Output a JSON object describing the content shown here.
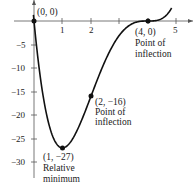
{
  "chart_data": {
    "type": "line",
    "title": "",
    "function": "f(x) = x(x - 4)^3",
    "xlabel": "",
    "ylabel": "",
    "xlim": [
      0,
      5.3
    ],
    "ylim": [
      -32,
      4
    ],
    "grid": false,
    "x_ticks": [
      1,
      2,
      5
    ],
    "x_tick_labels": [
      "1",
      "2",
      "5"
    ],
    "y_ticks": [
      -5,
      -10,
      -15,
      -20,
      -25,
      -30
    ],
    "y_tick_labels": [
      "-5",
      "-10",
      "-15",
      "-20",
      "-25",
      "-30"
    ],
    "series": [
      {
        "name": "f(x)",
        "x": [
          0,
          0.25,
          0.5,
          0.75,
          1,
          1.25,
          1.5,
          1.75,
          2,
          2.25,
          2.5,
          2.75,
          3,
          3.25,
          3.5,
          3.75,
          4,
          4.25,
          4.5,
          4.75
        ],
        "values": [
          0,
          -11.17,
          -21.44,
          -25.75,
          -27,
          -26.0,
          -23.44,
          -19.93,
          -16,
          -12.06,
          -8.44,
          -5.37,
          -3,
          -1.37,
          -0.44,
          -0.06,
          0,
          0.07,
          0.56,
          1.58
        ]
      }
    ],
    "points": [
      {
        "x": 0,
        "y": 0,
        "label": "(0, 0)"
      },
      {
        "x": 1,
        "y": -27,
        "label": "(1, −27)",
        "note": "Relative minimum"
      },
      {
        "x": 2,
        "y": -16,
        "label": "(2, −16)",
        "note": "Point of inflection"
      },
      {
        "x": 4,
        "y": 0,
        "label": "(4, 0)",
        "note": "Point of inflection"
      }
    ]
  },
  "labels": {
    "p0": "(0, 0)",
    "p1": "(1, −27)",
    "p1_note1": "Relative",
    "p1_note2": "minimum",
    "p2": "(2, −16)",
    "p2_note1": "Point of",
    "p2_note2": "inflection",
    "p4": "(4, 0)",
    "p4_note1": "Point of",
    "p4_note2": "inflection",
    "x1": "1",
    "x2": "2",
    "x5": "5",
    "y5": "−5",
    "y10": "−10",
    "y15": "−15",
    "y20": "−20",
    "y25": "−25",
    "y30": "−30"
  }
}
